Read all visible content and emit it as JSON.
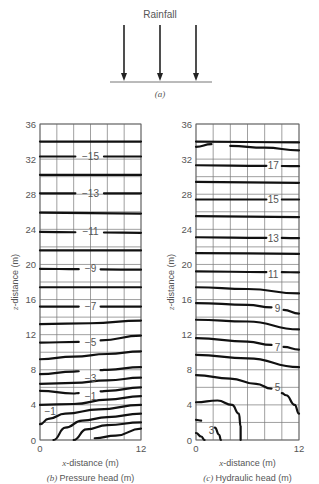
{
  "panel_a": {
    "title": "Rainfall",
    "caption": "(a)",
    "ground_y": 82,
    "ground_x": [
      110,
      212
    ],
    "arrows_x": [
      124,
      160,
      196
    ]
  },
  "chart_data": [
    {
      "id": "pressure_head",
      "type": "contour",
      "caption": "(b) Pressure head (m)",
      "caption_letter": "(b)",
      "caption_text": "Pressure head (m)",
      "xlabel": "x-distance (m)",
      "ylabel": "z-distance (m)",
      "xlim": [
        0,
        12
      ],
      "ylim": [
        0,
        36
      ],
      "x_ticks": [
        0,
        12
      ],
      "y_ticks": [
        0,
        4,
        8,
        12,
        16,
        20,
        24,
        28,
        32,
        36
      ],
      "grid_step": 2,
      "grid": true,
      "contour_labels": [
        {
          "text": "-15",
          "x": 6,
          "z": 32.3
        },
        {
          "text": "-13",
          "x": 6,
          "z": 28.1
        },
        {
          "text": "-11",
          "x": 6,
          "z": 23.7
        },
        {
          "text": "-9",
          "x": 6,
          "z": 19.5
        },
        {
          "text": "-7",
          "x": 6,
          "z": 15.2
        },
        {
          "text": "-5",
          "x": 6,
          "z": 11.1
        },
        {
          "text": "-3",
          "x": 6,
          "z": 7.0
        },
        {
          "text": "-1",
          "x": 6,
          "z": 4.9
        },
        {
          "text": "-1",
          "x": 1.2,
          "z": 3.3
        }
      ],
      "contours": [
        {
          "level": -16,
          "points": [
            [
              0,
              34.0
            ],
            [
              12,
              34.0
            ]
          ]
        },
        {
          "level": -15,
          "points": [
            [
              0,
              32.3
            ],
            [
              12,
              32.3
            ]
          ],
          "gap": [
            4.2,
            7.6
          ]
        },
        {
          "level": -14,
          "points": [
            [
              0,
              30.2
            ],
            [
              12,
              30.2
            ]
          ]
        },
        {
          "level": -13,
          "points": [
            [
              0,
              28.1
            ],
            [
              12,
              28.1
            ]
          ],
          "gap": [
            4.2,
            7.6
          ]
        },
        {
          "level": -12,
          "points": [
            [
              0,
              25.9
            ],
            [
              12,
              25.8
            ]
          ]
        },
        {
          "level": -11,
          "points": [
            [
              0,
              23.7
            ],
            [
              12,
              23.6
            ]
          ],
          "gap": [
            4.2,
            7.6
          ]
        },
        {
          "level": -10,
          "points": [
            [
              0,
              21.6
            ],
            [
              12,
              21.6
            ]
          ]
        },
        {
          "level": -9,
          "points": [
            [
              0,
              19.5
            ],
            [
              12,
              19.4
            ]
          ],
          "gap": [
            4.6,
            7.2
          ]
        },
        {
          "level": -8,
          "points": [
            [
              0,
              17.4
            ],
            [
              12,
              17.4
            ]
          ]
        },
        {
          "level": -7,
          "points": [
            [
              0,
              15.2
            ],
            [
              12,
              15.2
            ]
          ],
          "gap": [
            4.6,
            7.2
          ]
        },
        {
          "level": -6,
          "points": [
            [
              0,
              13.2
            ],
            [
              6,
              13.3
            ],
            [
              12,
              13.6
            ]
          ]
        },
        {
          "level": -5,
          "points": [
            [
              0,
              11.1
            ],
            [
              6,
              11.2
            ],
            [
              12,
              11.9
            ]
          ],
          "gap": [
            4.6,
            7.2
          ]
        },
        {
          "level": -4,
          "points": [
            [
              0,
              9.2
            ],
            [
              4,
              9.5
            ],
            [
              8,
              9.8
            ],
            [
              12,
              10.1
            ]
          ]
        },
        {
          "level": -3,
          "points": [
            [
              0,
              7.5
            ],
            [
              4,
              7.8
            ],
            [
              8,
              8.0
            ],
            [
              12,
              8.3
            ]
          ],
          "gap": [
            4.6,
            7.2
          ]
        },
        {
          "level": -2.5,
          "points": [
            [
              0,
              6.4
            ],
            [
              4,
              6.5
            ],
            [
              8,
              6.8
            ],
            [
              12,
              7.1
            ]
          ]
        },
        {
          "level": -2,
          "points": [
            [
              0,
              5.6
            ],
            [
              4,
              5.3
            ],
            [
              8,
              5.6
            ],
            [
              12,
              6.0
            ]
          ],
          "gap": [
            4.6,
            7.2
          ]
        },
        {
          "level": -1.5,
          "points": [
            [
              0,
              4.0
            ],
            [
              4,
              4.1
            ],
            [
              8,
              4.6
            ],
            [
              12,
              5.0
            ]
          ]
        },
        {
          "level": -1,
          "points": [
            [
              0,
              1.8
            ],
            [
              1,
              2.4
            ],
            [
              3,
              3.0
            ],
            [
              7,
              3.5
            ],
            [
              12,
              4.0
            ]
          ]
        },
        {
          "level": -0.5,
          "points": [
            [
              1.6,
              0
            ],
            [
              3,
              1.4
            ],
            [
              5,
              2.2
            ],
            [
              8,
              2.6
            ],
            [
              12,
              3.0
            ]
          ]
        },
        {
          "level": 0,
          "points": [
            [
              4,
              0
            ],
            [
              5.5,
              1.2
            ],
            [
              8,
              1.7
            ],
            [
              12,
              2.0
            ]
          ]
        },
        {
          "level": 0.5,
          "points": [
            [
              6.5,
              0.2
            ],
            [
              9,
              0.5
            ],
            [
              12,
              1.3
            ]
          ]
        }
      ]
    },
    {
      "id": "hydraulic_head",
      "type": "contour",
      "caption": "(c) Hydraulic head (m)",
      "caption_letter": "(c)",
      "caption_text": "Hydraulic head (m)",
      "xlabel": "x-distance (m)",
      "ylabel": "z-distance (m)",
      "xlim": [
        0,
        12
      ],
      "ylim": [
        0,
        36
      ],
      "x_ticks": [
        0,
        12
      ],
      "y_ticks": [
        0,
        4,
        8,
        12,
        16,
        20,
        24,
        28,
        32,
        36
      ],
      "grid_step": 2,
      "grid": true,
      "contour_labels": [
        {
          "text": "17",
          "x": 9.0,
          "z": 31.3
        },
        {
          "text": "15",
          "x": 9.0,
          "z": 27.4
        },
        {
          "text": "13",
          "x": 9.0,
          "z": 23.0
        },
        {
          "text": "11",
          "x": 9.0,
          "z": 18.8
        },
        {
          "text": "9",
          "x": 9.5,
          "z": 15.0
        },
        {
          "text": "7",
          "x": 9.5,
          "z": 10.5
        },
        {
          "text": "5",
          "x": 9.5,
          "z": 6.0
        },
        {
          "text": "3",
          "x": 1.8,
          "z": 1.1
        }
      ],
      "contours": [
        {
          "level": 18.5,
          "points": [
            [
              0,
              34.0
            ],
            [
              12,
              33.9
            ]
          ]
        },
        {
          "level": 18,
          "points": [
            [
              0,
              33.4
            ],
            [
              1.8,
              33.7
            ]
          ]
        },
        {
          "level": 18.2,
          "points": [
            [
              4,
              33.5
            ],
            [
              8,
              33.3
            ],
            [
              12,
              33.0
            ]
          ]
        },
        {
          "level": 17,
          "points": [
            [
              0,
              31.3
            ],
            [
              12,
              31.2
            ]
          ],
          "gap": [
            8.2,
            10.0
          ]
        },
        {
          "level": 16,
          "points": [
            [
              0,
              29.4
            ],
            [
              12,
              29.3
            ]
          ]
        },
        {
          "level": 15,
          "points": [
            [
              0,
              27.4
            ],
            [
              12,
              27.4
            ]
          ],
          "gap": [
            8.2,
            10.0
          ]
        },
        {
          "level": 14,
          "points": [
            [
              0,
              25.5
            ],
            [
              12,
              25.4
            ]
          ]
        },
        {
          "level": 13,
          "points": [
            [
              0,
              23.1
            ],
            [
              12,
              23.0
            ]
          ],
          "gap": [
            8.2,
            10.0
          ]
        },
        {
          "level": 12,
          "points": [
            [
              0,
              21.3
            ],
            [
              12,
              21.2
            ]
          ]
        },
        {
          "level": 11,
          "points": [
            [
              0,
              19.2
            ],
            [
              12,
              19.1
            ]
          ],
          "gap": [
            8.2,
            10.0
          ]
        },
        {
          "level": 10,
          "points": [
            [
              0,
              17.4
            ],
            [
              6,
              17.2
            ],
            [
              12,
              16.7
            ]
          ]
        },
        {
          "level": 9,
          "points": [
            [
              0,
              15.6
            ],
            [
              6,
              15.4
            ],
            [
              9,
              15.1
            ],
            [
              12,
              14.4
            ]
          ],
          "gap": [
            8.8,
            10.2
          ]
        },
        {
          "level": 8,
          "points": [
            [
              0,
              13.7
            ],
            [
              6,
              13.5
            ],
            [
              12,
              12.6
            ]
          ]
        },
        {
          "level": 7,
          "points": [
            [
              0,
              11.6
            ],
            [
              6,
              11.2
            ],
            [
              9,
              10.8
            ],
            [
              12,
              10.3
            ]
          ],
          "gap": [
            8.8,
            10.2
          ]
        },
        {
          "level": 6,
          "points": [
            [
              0,
              9.7
            ],
            [
              6,
              9.3
            ],
            [
              12,
              8.3
            ]
          ]
        },
        {
          "level": 5,
          "points": [
            [
              0,
              7.4
            ],
            [
              4,
              7.0
            ],
            [
              7,
              6.4
            ],
            [
              9,
              5.8
            ],
            [
              10.5,
              5.1
            ],
            [
              11.5,
              4.0
            ],
            [
              12,
              3.0
            ]
          ],
          "gap": [
            8.8,
            10.0
          ]
        },
        {
          "level": 4,
          "points": [
            [
              0,
              4.3
            ],
            [
              2.5,
              4.5
            ],
            [
              4.2,
              4.0
            ],
            [
              5,
              3.0
            ],
            [
              5.2,
              1.5
            ],
            [
              5.2,
              0
            ]
          ]
        },
        {
          "level": 3.5,
          "points": [
            [
              0,
              2.3
            ],
            [
              0.6,
              2.2
            ]
          ]
        },
        {
          "level": 3,
          "points": [
            [
              2.2,
              1.4
            ],
            [
              2.7,
              0.6
            ],
            [
              2.9,
              0
            ]
          ]
        },
        {
          "level": 2.5,
          "points": [
            [
              0,
              0.8
            ],
            [
              0.6,
              0.4
            ],
            [
              1.0,
              0
            ]
          ]
        }
      ]
    }
  ]
}
